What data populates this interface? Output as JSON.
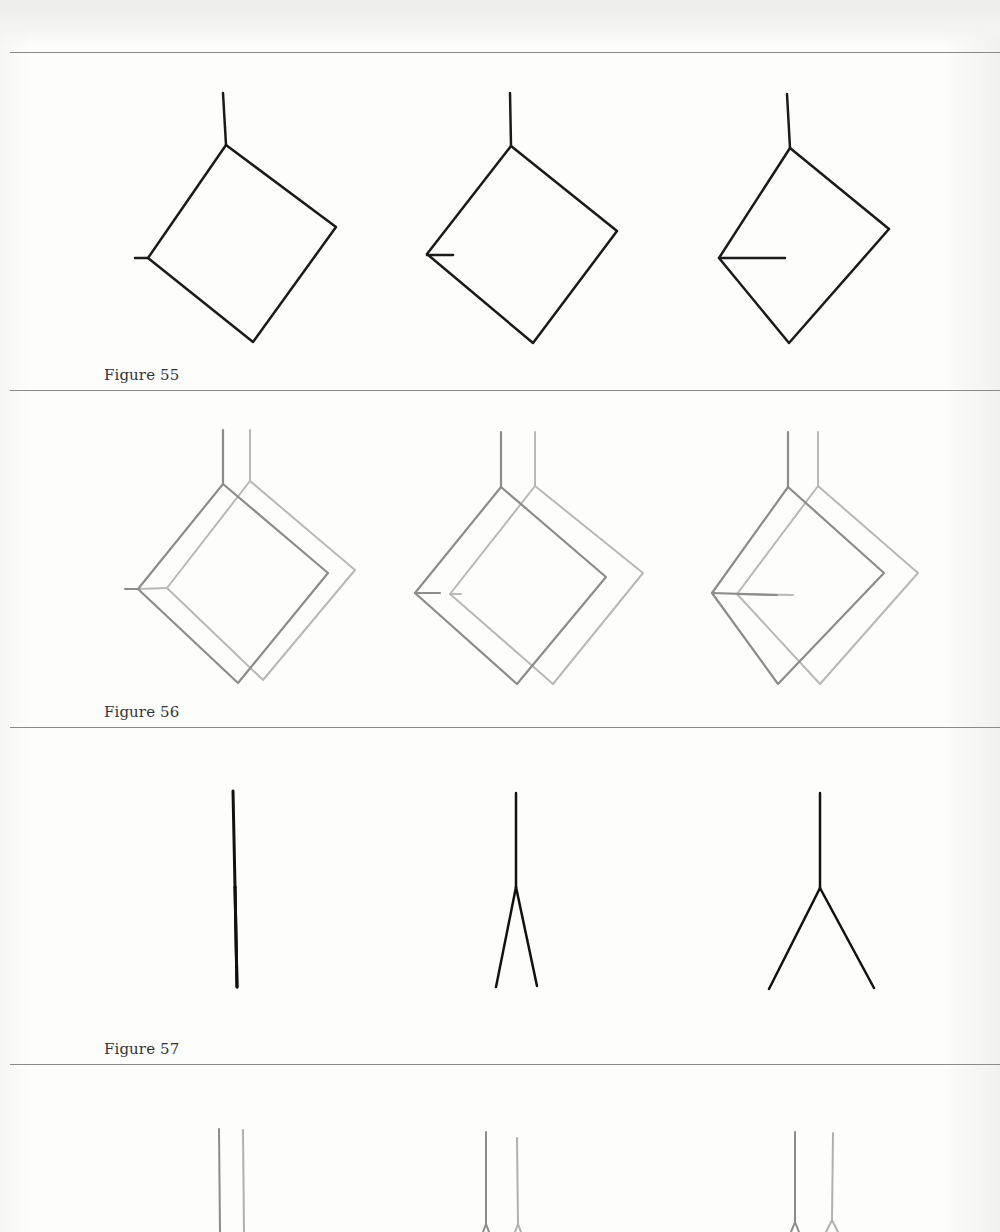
{
  "figures": [
    {
      "caption": "Figure 55",
      "caption_y": 366,
      "divider_y": 390,
      "panels": [
        {
          "label": "panel-1",
          "shapes": [
            {
              "color": "#1a1a1a",
              "width": 2.5,
              "stem": [
                [
                  223,
                  93
                ],
                [
                  226,
                  145
                ]
              ],
              "square": [
                [
                  226,
                  145
                ],
                [
                  336,
                  227
                ],
                [
                  253,
                  342
                ],
                [
                  148,
                  258
                ]
              ],
              "tick": [
                [
                  135,
                  258
                ],
                [
                  148,
                  258
                ]
              ]
            }
          ]
        },
        {
          "label": "panel-2",
          "shapes": [
            {
              "color": "#1a1a1a",
              "width": 2.5,
              "stem": [
                [
                  510,
                  93
                ],
                [
                  511,
                  146
                ]
              ],
              "square": [
                [
                  511,
                  146
                ],
                [
                  617,
                  231
                ],
                [
                  533,
                  343
                ],
                [
                  427,
                  254
                ]
              ],
              "tick": [
                [
                  427,
                  255
                ],
                [
                  453,
                  255
                ]
              ]
            }
          ]
        },
        {
          "label": "panel-3",
          "shapes": [
            {
              "color": "#1a1a1a",
              "width": 2.5,
              "stem": [
                [
                  787,
                  94
                ],
                [
                  790,
                  148
                ]
              ],
              "square": [
                [
                  790,
                  148
                ],
                [
                  889,
                  229
                ],
                [
                  789,
                  343
                ],
                [
                  719,
                  258
                ]
              ],
              "tick": [
                [
                  719,
                  258
                ],
                [
                  785,
                  258
                ]
              ]
            }
          ]
        }
      ]
    },
    {
      "caption": "Figure 56",
      "caption_y": 703,
      "divider_y": 727,
      "panels": [
        {
          "label": "panel-1",
          "shapes": [
            {
              "color": "#b8b8b8",
              "width": 2,
              "stem": [
                [
                  250,
                  430
                ],
                [
                  250,
                  481
                ]
              ],
              "square": [
                [
                  250,
                  481
                ],
                [
                  355,
                  570
                ],
                [
                  263,
                  680
                ],
                [
                  167,
                  588
                ]
              ],
              "tick": [
                [
                  138,
                  589
                ],
                [
                  167,
                  588
                ]
              ]
            },
            {
              "color": "#8c8c8c",
              "width": 2.2,
              "stem": [
                [
                  223,
                  430
                ],
                [
                  223,
                  484
                ]
              ],
              "square": [
                [
                  223,
                  484
                ],
                [
                  328,
                  573
                ],
                [
                  238,
                  683
                ],
                [
                  138,
                  589
                ]
              ],
              "tick": [
                [
                  125,
                  589
                ],
                [
                  138,
                  589
                ]
              ]
            }
          ]
        },
        {
          "label": "panel-2",
          "shapes": [
            {
              "color": "#b8b8b8",
              "width": 2,
              "stem": [
                [
                  535,
                  432
                ],
                [
                  535,
                  486
                ]
              ],
              "square": [
                [
                  535,
                  486
                ],
                [
                  643,
                  573
                ],
                [
                  553,
                  684
                ],
                [
                  450,
                  594
                ]
              ],
              "tick": [
                [
                  450,
                  594
                ],
                [
                  461,
                  594
                ]
              ]
            },
            {
              "color": "#8c8c8c",
              "width": 2.2,
              "stem": [
                [
                  501,
                  432
                ],
                [
                  501,
                  487
                ]
              ],
              "square": [
                [
                  501,
                  487
                ],
                [
                  606,
                  577
                ],
                [
                  517,
                  684
                ],
                [
                  415,
                  593
                ]
              ],
              "tick": [
                [
                  415,
                  593
                ],
                [
                  440,
                  593
                ]
              ]
            }
          ]
        },
        {
          "label": "panel-3",
          "shapes": [
            {
              "color": "#b8b8b8",
              "width": 2,
              "stem": [
                [
                  818,
                  432
                ],
                [
                  818,
                  486
                ]
              ],
              "square": [
                [
                  818,
                  486
                ],
                [
                  918,
                  573
                ],
                [
                  820,
                  684
                ],
                [
                  737,
                  594
                ]
              ],
              "tick": [
                [
                  737,
                  594
                ],
                [
                  793,
                  595
                ]
              ]
            },
            {
              "color": "#8c8c8c",
              "width": 2.2,
              "stem": [
                [
                  788,
                  432
                ],
                [
                  788,
                  487
                ]
              ],
              "square": [
                [
                  788,
                  487
                ],
                [
                  884,
                  573
                ],
                [
                  778,
                  684
                ],
                [
                  712,
                  593
                ]
              ],
              "tick": [
                [
                  712,
                  593
                ],
                [
                  777,
                  595
                ]
              ]
            }
          ]
        }
      ]
    },
    {
      "caption": "Figure 57",
      "caption_y": 1040,
      "divider_y": 1064,
      "panels": [
        {
          "label": "panel-1",
          "forks": [
            {
              "color": "#111111",
              "width": 3,
              "stem": [
                [
                  233,
                  791
                ],
                [
                  235,
                  887
                ]
              ],
              "legs": [
                [
                  [
                    235,
                    887
                  ],
                  [
                    237,
                    987
                  ]
                ],
                [
                  [
                    235,
                    887
                  ],
                  [
                    237,
                    987
                  ]
                ]
              ]
            }
          ]
        },
        {
          "label": "panel-2",
          "forks": [
            {
              "color": "#111111",
              "width": 2.5,
              "stem": [
                [
                  516,
                  793
                ],
                [
                  516,
                  887
                ]
              ],
              "legs": [
                [
                  [
                    516,
                    887
                  ],
                  [
                    496,
                    987
                  ]
                ],
                [
                  [
                    516,
                    887
                  ],
                  [
                    537,
                    986
                  ]
                ]
              ]
            }
          ]
        },
        {
          "label": "panel-3",
          "forks": [
            {
              "color": "#111111",
              "width": 2.5,
              "stem": [
                [
                  820,
                  793
                ],
                [
                  820,
                  888
                ]
              ],
              "legs": [
                [
                  [
                    820,
                    888
                  ],
                  [
                    769,
                    989
                  ]
                ],
                [
                  [
                    820,
                    888
                  ],
                  [
                    874,
                    988
                  ]
                ]
              ]
            }
          ]
        }
      ]
    },
    {
      "caption": "",
      "caption_y": null,
      "divider_y": null,
      "panels": [
        {
          "label": "panel-1",
          "forks": [
            {
              "color": "#8c8c8c",
              "width": 2,
              "stem": [
                [
                  219,
                  1129
                ],
                [
                  220,
                  1232
                ]
              ],
              "legs": []
            },
            {
              "color": "#b0b0b0",
              "width": 2,
              "stem": [
                [
                  243,
                  1130
                ],
                [
                  244,
                  1232
                ]
              ],
              "legs": []
            }
          ]
        },
        {
          "label": "panel-2",
          "forks": [
            {
              "color": "#8c8c8c",
              "width": 2,
              "stem": [
                [
                  486,
                  1132
                ],
                [
                  486,
                  1224
                ]
              ],
              "legs": [
                [
                  [
                    486,
                    1224
                  ],
                  [
                    483,
                    1232
                  ]
                ],
                [
                  [
                    486,
                    1224
                  ],
                  [
                    489,
                    1232
                  ]
                ]
              ]
            },
            {
              "color": "#b0b0b0",
              "width": 2,
              "stem": [
                [
                  517,
                  1138
                ],
                [
                  518,
                  1224
                ]
              ],
              "legs": [
                [
                  [
                    518,
                    1224
                  ],
                  [
                    515,
                    1232
                  ]
                ],
                [
                  [
                    518,
                    1224
                  ],
                  [
                    521,
                    1232
                  ]
                ]
              ]
            }
          ]
        },
        {
          "label": "panel-3",
          "forks": [
            {
              "color": "#8c8c8c",
              "width": 2,
              "stem": [
                [
                  795,
                  1132
                ],
                [
                  795,
                  1222
                ]
              ],
              "legs": [
                [
                  [
                    795,
                    1222
                  ],
                  [
                    791,
                    1232
                  ]
                ],
                [
                  [
                    795,
                    1222
                  ],
                  [
                    799,
                    1232
                  ]
                ]
              ]
            },
            {
              "color": "#b0b0b0",
              "width": 2,
              "stem": [
                [
                  833,
                  1133
                ],
                [
                  832,
                  1220
                ]
              ],
              "legs": [
                [
                  [
                    832,
                    1220
                  ],
                  [
                    826,
                    1232
                  ]
                ],
                [
                  [
                    832,
                    1220
                  ],
                  [
                    838,
                    1232
                  ]
                ]
              ]
            }
          ]
        }
      ]
    }
  ],
  "top_divider_y": 52,
  "colors": {
    "ink": "#1a1a1a",
    "gray_dark": "#8c8c8c",
    "gray_light": "#b8b8b8",
    "rule": "#8a8a8a"
  }
}
